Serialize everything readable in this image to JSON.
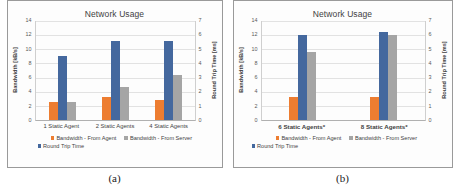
{
  "figures": [
    {
      "caption": "(a)",
      "chart_data": {
        "type": "bar",
        "title": "Network Usage",
        "xlabel": "",
        "ylabel": "Bandwidth [kB/s]",
        "y2label": "Round Trip Time [ms]",
        "ylim": [
          0,
          14
        ],
        "y2lim": [
          0,
          7
        ],
        "yticks": [
          14,
          12,
          10,
          8,
          6,
          4,
          2,
          0
        ],
        "y2ticks": [
          7,
          6,
          5,
          4,
          3,
          2,
          1,
          0
        ],
        "grid": true,
        "legend_position": "bottom",
        "categories": [
          "1 Static Agent",
          "2 Static Agents",
          "4 Static Agents"
        ],
        "series": [
          {
            "name": "Bandwidth - From Agent",
            "axis": "left",
            "unit": "kB/s",
            "color": "#ED7D31",
            "values": [
              2.6,
              3.2,
              2.8
            ]
          },
          {
            "name": "Bandwidth - From Server",
            "axis": "left",
            "unit": "kB/s",
            "color": "#44689E",
            "values": [
              9.0,
              11.2,
              11.2
            ]
          },
          {
            "name": "Round Trip Time",
            "axis": "right",
            "unit": "ms",
            "color": "#A5A5A5",
            "values": [
              1.25,
              2.3,
              3.15
            ]
          }
        ],
        "legend_entries": [
          "Bandwidth - From Agent",
          "Bandwidth - From Server",
          "Round Trip Time"
        ]
      }
    },
    {
      "caption": "(b)",
      "chart_data": {
        "type": "bar",
        "title": "Network Usage",
        "xlabel": "",
        "ylabel": "Bandwidth [kB/s]",
        "y2label": "Round Trip Time [ms]",
        "ylim": [
          0,
          14
        ],
        "y2lim": [
          0,
          7
        ],
        "yticks": [
          14,
          12,
          10,
          8,
          6,
          4,
          2,
          0
        ],
        "y2ticks": [
          7,
          6,
          5,
          4,
          3,
          2,
          1,
          0
        ],
        "grid": true,
        "legend_position": "bottom",
        "categories": [
          "6 Static Agents*",
          "8 Static Agents*"
        ],
        "series": [
          {
            "name": "Bandwidth - From Agent",
            "axis": "left",
            "unit": "kB/s",
            "color": "#ED7D31",
            "values": [
              3.2,
              3.3
            ]
          },
          {
            "name": "Bandwidth - From Server",
            "axis": "left",
            "unit": "kB/s",
            "color": "#44689E",
            "values": [
              12.0,
              12.4
            ]
          },
          {
            "name": "Round Trip Time",
            "axis": "right",
            "unit": "ms",
            "color": "#A5A5A5",
            "values": [
              4.8,
              6.0
            ]
          }
        ],
        "legend_entries": [
          "Bandwidth - From Agent",
          "Bandwidth - From Server",
          "Round Trip Time"
        ]
      }
    }
  ]
}
